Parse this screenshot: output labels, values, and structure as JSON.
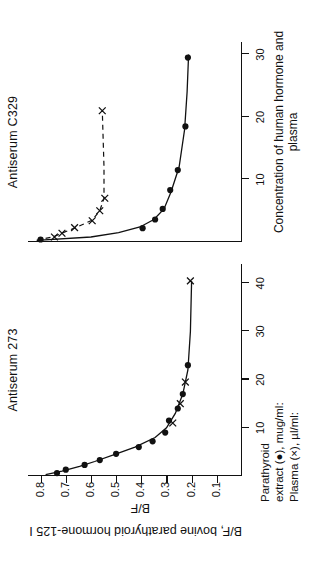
{
  "figure": {
    "y_axis_caption": "B/F, bovine parathyroid hormone-125 I",
    "x_axis_caption": "Concentration of human hormone and plasma",
    "bf_label": "B/F",
    "legend": [
      "Parathyroid",
      "extract (●), mug/ml:",
      "Plasma (×), µl/ml:"
    ]
  },
  "chart_data": {
    "type": "scatter",
    "xlabel": "Concentration of human hormone and plasma",
    "ylabel": "B/F, bovine parathyroid hormone-125 I",
    "grid": false,
    "legend_position": "below-left",
    "panels": [
      {
        "name": "Antiserum 273",
        "xlim": [
          0,
          44
        ],
        "ylim": [
          0,
          0.85
        ],
        "xticks": [
          10,
          20,
          30,
          40
        ],
        "yticks": [
          0.1,
          0.2,
          0.3,
          0.4,
          0.5,
          0.6,
          0.7,
          0.8
        ],
        "ytick_labels": [
          "0.1",
          "0.2",
          "0.3",
          "0.4",
          "0.5",
          "0.6",
          "0.7",
          "0.8"
        ],
        "xtick_labels": [
          "10",
          "20",
          "30",
          "40"
        ],
        "series": [
          {
            "name": "Parathyroid extract (●), mug/ml",
            "marker": "filled-circle",
            "points": [
              {
                "x": 0.6,
                "y": 0.735
              },
              {
                "x": 1.3,
                "y": 0.7
              },
              {
                "x": 2.3,
                "y": 0.625
              },
              {
                "x": 3.3,
                "y": 0.565
              },
              {
                "x": 4.6,
                "y": 0.5
              },
              {
                "x": 6.0,
                "y": 0.41
              },
              {
                "x": 7.2,
                "y": 0.355
              },
              {
                "x": 9.0,
                "y": 0.305
              },
              {
                "x": 11.5,
                "y": 0.29
              },
              {
                "x": 14.0,
                "y": 0.255
              },
              {
                "x": 17.0,
                "y": 0.235
              },
              {
                "x": 23.0,
                "y": 0.215
              }
            ]
          },
          {
            "name": "Plasma (×), µl/ml",
            "marker": "cross",
            "points": [
              {
                "x": 11.0,
                "y": 0.275
              },
              {
                "x": 15.0,
                "y": 0.245
              },
              {
                "x": 19.5,
                "y": 0.225
              },
              {
                "x": 40.5,
                "y": 0.205
              }
            ]
          }
        ],
        "curve": [
          {
            "x": 0.3,
            "y": 0.78
          },
          {
            "x": 1.0,
            "y": 0.715
          },
          {
            "x": 2.0,
            "y": 0.645
          },
          {
            "x": 3.0,
            "y": 0.585
          },
          {
            "x": 4.5,
            "y": 0.505
          },
          {
            "x": 6.0,
            "y": 0.425
          },
          {
            "x": 8.0,
            "y": 0.345
          },
          {
            "x": 10.0,
            "y": 0.3
          },
          {
            "x": 13.0,
            "y": 0.265
          },
          {
            "x": 17.0,
            "y": 0.235
          },
          {
            "x": 22.0,
            "y": 0.215
          },
          {
            "x": 30.0,
            "y": 0.205
          },
          {
            "x": 40.5,
            "y": 0.2
          }
        ]
      },
      {
        "name": "Antiserum C329",
        "xlim": [
          0,
          32
        ],
        "ylim": [
          0,
          0.85
        ],
        "xticks": [
          10,
          20,
          30
        ],
        "xtick_labels": [
          "10",
          "20",
          "30"
        ],
        "yticks": [],
        "ytick_labels": [],
        "series": [
          {
            "name": "Parathyroid extract (●), mug/ml",
            "marker": "filled-circle",
            "points": [
              {
                "x": 0.4,
                "y": 0.8
              },
              {
                "x": 2.2,
                "y": 0.395
              },
              {
                "x": 3.6,
                "y": 0.345
              },
              {
                "x": 5.3,
                "y": 0.315
              },
              {
                "x": 8.3,
                "y": 0.285
              },
              {
                "x": 11.5,
                "y": 0.255
              },
              {
                "x": 18.5,
                "y": 0.225
              },
              {
                "x": 29.5,
                "y": 0.215
              }
            ]
          },
          {
            "name": "Plasma (×), µl/ml",
            "marker": "cross",
            "points": [
              {
                "x": 0.8,
                "y": 0.745
              },
              {
                "x": 1.4,
                "y": 0.715
              },
              {
                "x": 2.3,
                "y": 0.665
              },
              {
                "x": 3.4,
                "y": 0.595
              },
              {
                "x": 5.0,
                "y": 0.565
              },
              {
                "x": 7.0,
                "y": 0.545
              },
              {
                "x": 21.0,
                "y": 0.555
              }
            ]
          }
        ],
        "curve": [
          {
            "x": 0.25,
            "y": 0.815
          },
          {
            "x": 0.8,
            "y": 0.6
          },
          {
            "x": 1.5,
            "y": 0.49
          },
          {
            "x": 2.4,
            "y": 0.405
          },
          {
            "x": 3.6,
            "y": 0.35
          },
          {
            "x": 5.3,
            "y": 0.31
          },
          {
            "x": 8.0,
            "y": 0.282
          },
          {
            "x": 12.0,
            "y": 0.25
          },
          {
            "x": 18.0,
            "y": 0.228
          },
          {
            "x": 24.0,
            "y": 0.218
          },
          {
            "x": 30.0,
            "y": 0.212
          }
        ],
        "curve_dashed": [
          {
            "x": 0.25,
            "y": 0.815
          },
          {
            "x": 0.9,
            "y": 0.745
          },
          {
            "x": 1.5,
            "y": 0.71
          },
          {
            "x": 2.4,
            "y": 0.655
          },
          {
            "x": 3.5,
            "y": 0.595
          },
          {
            "x": 5.0,
            "y": 0.565
          },
          {
            "x": 7.0,
            "y": 0.548
          },
          {
            "x": 12.0,
            "y": 0.548
          },
          {
            "x": 21.0,
            "y": 0.555
          }
        ]
      }
    ]
  }
}
